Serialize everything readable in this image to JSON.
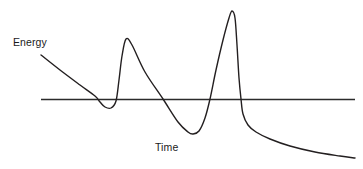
{
  "figure": {
    "background_color": "#ffffff",
    "line_color": "#231f20",
    "text_color": "#1a1a1a",
    "width": 363,
    "height": 169
  },
  "labels": {
    "y_axis": "Energy",
    "x_axis": "Time"
  },
  "chart_data": {
    "type": "line",
    "title": "",
    "xlabel": "Time",
    "ylabel": "Energy",
    "grid": false,
    "legend": null,
    "axis": {
      "baseline_y_pixel": 99,
      "baseline_x_start_pixel": 41,
      "baseline_x_end_pixel": 355,
      "zero_line": true,
      "tick_labels_x": [],
      "tick_labels_y": [],
      "axis_ranges_labeled": false
    },
    "series": [
      {
        "name": "Energy",
        "description": "Damped-then-resonant oscillation: initial linear decay below zero, small dip, sharp positive spike, deep negative trough, very tall positive spike, then long decaying tail below the baseline.",
        "color": "#231f20",
        "points_pixel": [
          [
            41,
            55
          ],
          [
            60,
            70
          ],
          [
            80,
            85
          ],
          [
            95,
            96
          ],
          [
            100,
            102
          ],
          [
            105,
            107
          ],
          [
            111,
            108
          ],
          [
            116,
            101
          ],
          [
            119,
            80
          ],
          [
            122,
            56
          ],
          [
            126,
            39
          ],
          [
            132,
            45
          ],
          [
            145,
            72
          ],
          [
            163,
            99
          ],
          [
            178,
            122
          ],
          [
            188,
            132
          ],
          [
            193,
            134
          ],
          [
            199,
            131
          ],
          [
            205,
            118
          ],
          [
            210,
            99
          ],
          [
            216,
            70
          ],
          [
            223,
            40
          ],
          [
            229,
            18
          ],
          [
            232,
            11
          ],
          [
            235,
            18
          ],
          [
            237,
            45
          ],
          [
            239,
            78
          ],
          [
            241,
            99
          ],
          [
            243,
            114
          ],
          [
            248,
            125
          ],
          [
            256,
            132
          ],
          [
            270,
            139
          ],
          [
            290,
            146
          ],
          [
            315,
            152
          ],
          [
            340,
            156
          ],
          [
            355,
            158
          ]
        ],
        "features": [
          {
            "name": "start",
            "x": 41,
            "y": 55,
            "note": "curve origin, high positive energy"
          },
          {
            "name": "first-zero-crossing-down",
            "x": 97,
            "y": 99
          },
          {
            "name": "shallow-dip-minimum",
            "x": 106,
            "y": 108
          },
          {
            "name": "second-zero-crossing-up",
            "x": 117,
            "y": 99
          },
          {
            "name": "first-peak-maximum",
            "x": 126,
            "y": 39
          },
          {
            "name": "third-zero-crossing-down",
            "x": 163,
            "y": 99
          },
          {
            "name": "deep-trough-minimum",
            "x": 193,
            "y": 134
          },
          {
            "name": "fourth-zero-crossing-up",
            "x": 211,
            "y": 99
          },
          {
            "name": "second-peak-maximum",
            "x": 232,
            "y": 11
          },
          {
            "name": "fifth-zero-crossing-down",
            "x": 241,
            "y": 99
          },
          {
            "name": "tail-end",
            "x": 355,
            "y": 158
          }
        ]
      }
    ]
  }
}
